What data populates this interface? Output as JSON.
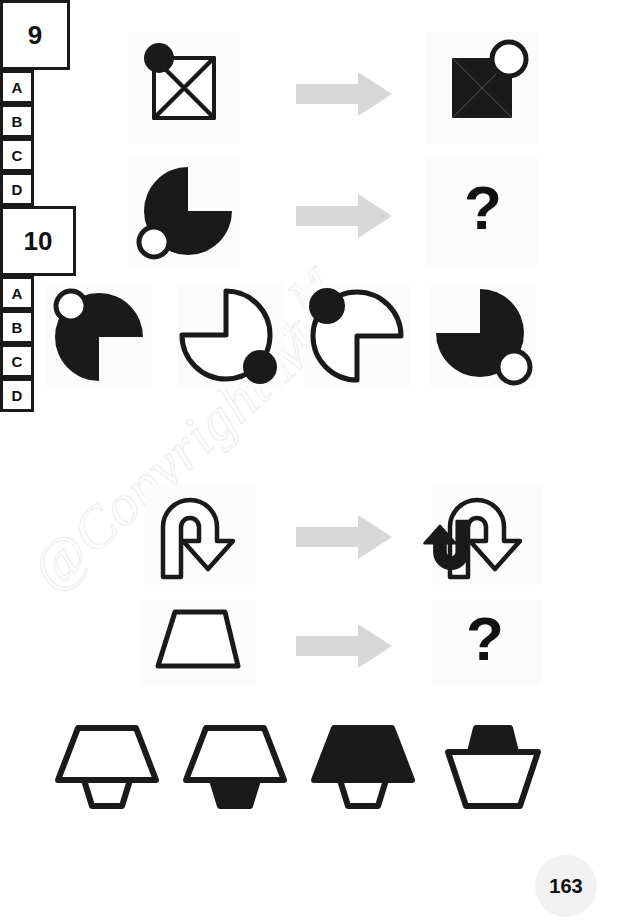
{
  "page": {
    "number": "163",
    "background": "#ffffff",
    "ink": "#1a1a1a",
    "arrow_color": "#d7d7d7",
    "watermark_line1": "@Copyright M",
    "watermark_line2": "ight M"
  },
  "puzzles": [
    {
      "id": "puzzle-9",
      "number": "9",
      "rows": [
        {
          "name": "example-row",
          "source": {
            "shape": "maltese-cross-outline-with-black-circle",
            "description": "Four-triangle pinwheel cross drawn as white outline, small filled black circle at upper-left",
            "fill": "white",
            "accent_circle_fill": "black",
            "accent_circle_position": "upper-left"
          },
          "arrow": "right-arrow",
          "result": {
            "shape": "maltese-cross-filled-with-white-circle",
            "description": "Same pinwheel cross filled solid black, circle now white outline at upper-right",
            "fill": "black",
            "accent_circle_fill": "white",
            "accent_circle_position": "upper-right"
          }
        },
        {
          "name": "question-row",
          "source": {
            "shape": "pac-circle-black-quadrant-upper-right-removed",
            "description": "Solid black circle with upper-right quadrant cut out, small white outline circle at lower-left",
            "fill": "black",
            "missing_quadrant": "upper-right",
            "accent_circle_fill": "white",
            "accent_circle_position": "lower-left"
          },
          "arrow": "right-arrow",
          "result": {
            "shape": "question-mark",
            "label": "?"
          }
        }
      ],
      "options": [
        {
          "letter": "A",
          "shape": "pac-circle-black-quadrant-lower-right-removed",
          "fill": "black",
          "missing_quadrant": "lower-right",
          "accent_circle_fill": "white",
          "accent_circle_position": "upper-left"
        },
        {
          "letter": "B",
          "shape": "pac-circle-white-quadrant-upper-left-removed",
          "fill": "white",
          "missing_quadrant": "upper-left",
          "accent_circle_fill": "black",
          "accent_circle_position": "lower-right"
        },
        {
          "letter": "C",
          "shape": "pac-circle-white-quadrant-lower-right-removed",
          "fill": "white",
          "missing_quadrant": "lower-right",
          "accent_circle_fill": "black",
          "accent_circle_position": "upper-left"
        },
        {
          "letter": "D",
          "shape": "pac-circle-black-quadrant-upper-left-removed",
          "fill": "black",
          "missing_quadrant": "upper-left",
          "accent_circle_fill": "white",
          "accent_circle_position": "lower-right"
        }
      ]
    },
    {
      "id": "puzzle-10",
      "number": "10",
      "rows": [
        {
          "name": "example-row",
          "source": {
            "shape": "u-turn-arrow-outline",
            "description": "Large U-turn arrow drawn as white outline, head pointing down-right",
            "fill": "white"
          },
          "arrow": "right-arrow",
          "result": {
            "shape": "u-turn-arrow-outline-with-small-black-copy",
            "description": "Same large outline U-turn arrow overlaid with a smaller solid black U-turn arrow pointing up",
            "fill": "white",
            "overlay_fill": "black"
          }
        },
        {
          "name": "question-row",
          "source": {
            "shape": "trapezoid-outline-wide-bottom",
            "description": "White trapezoid outline, wider at the bottom",
            "fill": "white"
          },
          "arrow": "right-arrow",
          "result": {
            "shape": "question-mark",
            "label": "?"
          }
        }
      ],
      "options": [
        {
          "letter": "A",
          "shape": "large-white-trapezoid-with-small-white-trapezoid-below",
          "large_fill": "white",
          "small_fill": "white",
          "small_position": "below"
        },
        {
          "letter": "B",
          "shape": "large-white-trapezoid-with-small-black-trapezoid-below",
          "large_fill": "white",
          "small_fill": "black",
          "small_position": "below"
        },
        {
          "letter": "C",
          "shape": "large-black-trapezoid-with-small-white-trapezoid-below",
          "large_fill": "black",
          "small_fill": "white",
          "small_position": "below"
        },
        {
          "letter": "D",
          "shape": "large-inverted-white-trapezoid-with-small-black-trapezoid-above",
          "large_fill": "white",
          "small_fill": "black",
          "small_position": "above",
          "orientation": "inverted"
        }
      ]
    }
  ]
}
